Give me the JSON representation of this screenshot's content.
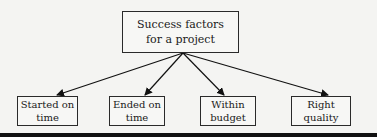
{
  "diagram": {
    "root": {
      "line1": "Success factors",
      "line2": "for a project"
    },
    "children": [
      {
        "line1": "Started on",
        "line2": "time"
      },
      {
        "line1": "Ended on",
        "line2": "time"
      },
      {
        "line1": "Within",
        "line2": "budget"
      },
      {
        "line1": "Right",
        "line2": "quality"
      }
    ]
  }
}
